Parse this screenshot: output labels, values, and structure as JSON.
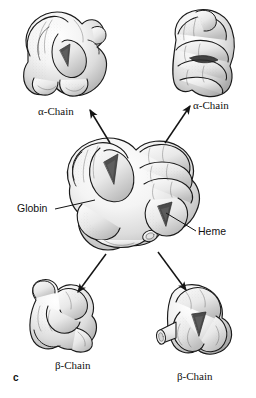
{
  "figure": {
    "panel_letter": "c",
    "background_color": "#ffffff",
    "ink_color": "#111111"
  },
  "labels": {
    "alpha_chain_left": "α-Chain",
    "alpha_chain_right": "α-Chain",
    "beta_chain_left": "β-Chain",
    "beta_chain_right": "β-Chain",
    "globin": "Globin",
    "heme": "Heme"
  },
  "structures": [
    {
      "id": "alpha-chain-left",
      "label": "α-Chain",
      "position": "top-left",
      "description": "folded globular polypeptide with triangular heme cavity"
    },
    {
      "id": "alpha-chain-right",
      "label": "α-Chain",
      "position": "top-right",
      "description": "vertically coiled polypeptide with dark heme slot"
    },
    {
      "id": "hemoglobin-tetramer",
      "label": "",
      "position": "center",
      "description": "assembled tetramer of two alpha and two beta chains"
    },
    {
      "id": "beta-chain-left",
      "label": "β-Chain",
      "position": "bottom-left",
      "description": "compact coiled polypeptide"
    },
    {
      "id": "beta-chain-right",
      "label": "β-Chain",
      "position": "bottom-right",
      "description": "V-shaped polypeptide with cylindrical heme group"
    }
  ],
  "arrows": [
    {
      "id": "arrow-to-alpha-left",
      "from": "hemoglobin-tetramer",
      "to": "alpha-chain-left",
      "direction": "up-left"
    },
    {
      "id": "arrow-to-alpha-right",
      "from": "hemoglobin-tetramer",
      "to": "alpha-chain-right",
      "direction": "up-right"
    },
    {
      "id": "arrow-to-beta-left",
      "from": "hemoglobin-tetramer",
      "to": "beta-chain-left",
      "direction": "down-left"
    },
    {
      "id": "arrow-to-beta-right",
      "from": "hemoglobin-tetramer",
      "to": "beta-chain-right",
      "direction": "down-right"
    }
  ],
  "leader_lines": [
    {
      "id": "leader-globin",
      "label": "Globin",
      "target": "hemoglobin-tetramer-surface"
    },
    {
      "id": "leader-heme",
      "label": "Heme",
      "target": "hemoglobin-tetramer-heme-pocket"
    }
  ]
}
